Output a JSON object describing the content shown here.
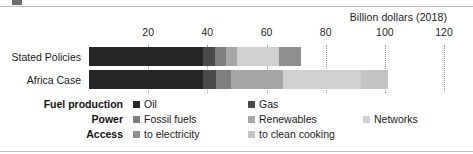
{
  "chart_data": {
    "type": "bar",
    "orientation": "horizontal",
    "stacked": true,
    "title": "",
    "subtitle": "",
    "unit_label": "Billion dollars (2018)",
    "xlabel": "",
    "ylabel": "",
    "xlim": [
      0,
      120
    ],
    "xticks": [
      20,
      40,
      60,
      80,
      100,
      120
    ],
    "xtick_labels": [
      "20",
      "40",
      "60",
      "80",
      "100",
      "120"
    ],
    "grid": true,
    "legend_position": "bottom",
    "categories": [
      "Stated Policies",
      "Africa Case"
    ],
    "series": [
      {
        "name": "Oil",
        "group": "Fuel production",
        "color": "#262626",
        "values": [
          38.6,
          38.6
        ]
      },
      {
        "name": "Gas",
        "group": "Fuel production",
        "color": "#4a4a4a",
        "values": [
          4.1,
          4.4
        ]
      },
      {
        "name": "Fossil fuels",
        "group": "Power",
        "color": "#7f7f7f",
        "values": [
          3.7,
          5.1
        ]
      },
      {
        "name": "Renewables",
        "group": "Power",
        "color": "#a6a6a6",
        "values": [
          3.7,
          17.6
        ]
      },
      {
        "name": "Networks",
        "group": "Power",
        "color": "#d0d0d0",
        "values": [
          14.2,
          26.1
        ]
      },
      {
        "name": "to electricity",
        "group": "Access",
        "color": "#8f8f8f",
        "values": [
          7.2,
          0
        ]
      },
      {
        "name": "to clean cooking",
        "group": "Access",
        "color": "#c4c4c4",
        "values": [
          0,
          9.2
        ]
      }
    ],
    "totals": [
      71.5,
      101.0
    ]
  },
  "axis": {
    "unit_label": "Billion dollars (2018)",
    "ticks": [
      {
        "value": 20,
        "label": "20"
      },
      {
        "value": 40,
        "label": "40"
      },
      {
        "value": 60,
        "label": "60"
      },
      {
        "value": 80,
        "label": "80"
      },
      {
        "value": 100,
        "label": "100"
      },
      {
        "value": 120,
        "label": "120"
      }
    ]
  },
  "categories": [
    {
      "label": "Stated Policies"
    },
    {
      "label": "Africa Case"
    }
  ],
  "legend": {
    "rows": [
      {
        "group": "Fuel production",
        "items": [
          {
            "label": "Oil",
            "color": "#262626"
          },
          {
            "label": "Gas",
            "color": "#4a4a4a"
          }
        ]
      },
      {
        "group": "Power",
        "items": [
          {
            "label": "Fossil fuels",
            "color": "#7f7f7f"
          },
          {
            "label": "Renewables",
            "color": "#a6a6a6"
          },
          {
            "label": "Networks",
            "color": "#d0d0d0"
          }
        ]
      },
      {
        "group": "Access",
        "items": [
          {
            "label": "to electricity",
            "color": "#8f8f8f"
          },
          {
            "label": "to clean cooking",
            "color": "#c4c4c4"
          }
        ]
      }
    ]
  }
}
